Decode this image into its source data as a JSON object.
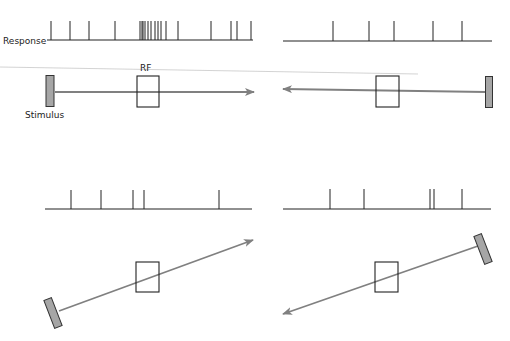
{
  "labels": {
    "response": "Response",
    "rf": "RF",
    "stimulus": "Stimulus"
  },
  "colors": {
    "line": "#222222",
    "arrow": "#808080",
    "stimulus_fill": "#a6a6a6",
    "stimulus_stroke": "#333333",
    "guide": "#c8c8c8"
  },
  "panels": [
    {
      "id": "top-left",
      "motion": "rightward",
      "response": {
        "x1": 47,
        "x2": 253,
        "y": 40,
        "spike_height": 19,
        "spikes": [
          51,
          70,
          89,
          115,
          140,
          142,
          143,
          145,
          148,
          151,
          155,
          158,
          161,
          166,
          178,
          211,
          231,
          237,
          251
        ]
      },
      "rf_box": {
        "x": 137,
        "y": 76,
        "w": 22,
        "h": 31
      },
      "stimulus_bar": {
        "cx": 50,
        "cy": 91,
        "w": 8,
        "h": 31,
        "angle": 0
      },
      "arrow": {
        "x1": 55,
        "y1": 92,
        "x2": 254,
        "y2": 92
      }
    },
    {
      "id": "top-right",
      "motion": "leftward",
      "response": {
        "x1": 283,
        "x2": 492,
        "y": 41,
        "spike_height": 20,
        "spikes": [
          333,
          369,
          394,
          433,
          462
        ]
      },
      "rf_box": {
        "x": 376,
        "y": 76,
        "w": 23,
        "h": 31
      },
      "stimulus_bar": {
        "cx": 489,
        "cy": 92,
        "w": 7,
        "h": 31,
        "angle": 0
      },
      "arrow": {
        "x1": 486,
        "y1": 92,
        "x2": 283,
        "y2": 89
      }
    },
    {
      "id": "bottom-left",
      "motion": "up-right",
      "response": {
        "x1": 45,
        "x2": 252,
        "y": 209,
        "spike_height": 19,
        "spikes": [
          71,
          101,
          133,
          144,
          219
        ]
      },
      "rf_box": {
        "x": 136,
        "y": 262,
        "w": 23,
        "h": 30
      },
      "stimulus_bar": {
        "cx": 53,
        "cy": 313,
        "w": 8,
        "h": 30,
        "angle": -21
      },
      "arrow": {
        "x1": 59,
        "y1": 311,
        "x2": 253,
        "y2": 240
      }
    },
    {
      "id": "bottom-right",
      "motion": "down-left",
      "response": {
        "x1": 283,
        "x2": 491,
        "y": 209,
        "spike_height": 20,
        "spikes": [
          330,
          364,
          430,
          434,
          462
        ]
      },
      "rf_box": {
        "x": 375,
        "y": 262,
        "w": 23,
        "h": 30
      },
      "stimulus_bar": {
        "cx": 483,
        "cy": 249,
        "w": 8,
        "h": 30,
        "angle": -21
      },
      "arrow": {
        "x1": 478,
        "y1": 246,
        "x2": 283,
        "y2": 314
      }
    }
  ],
  "guide_line": {
    "x1": 0,
    "y1": 67,
    "x2": 418,
    "y2": 74
  },
  "text_positions": {
    "response": {
      "x": 3,
      "y": 44
    },
    "rf": {
      "x": 140,
      "y": 71
    },
    "stimulus": {
      "x": 25,
      "y": 118
    }
  }
}
